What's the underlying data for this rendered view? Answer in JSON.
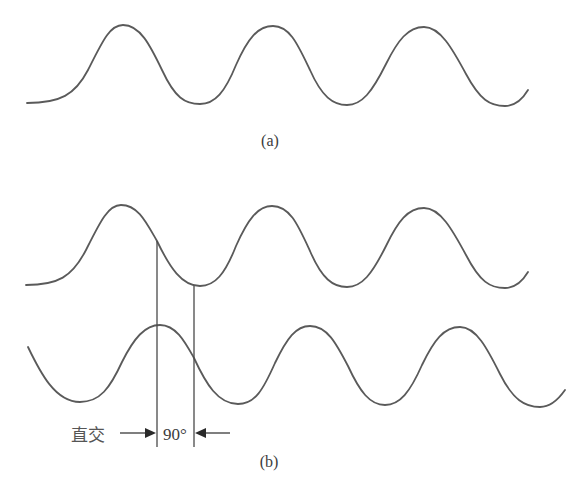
{
  "figure": {
    "panel_a": {
      "caption": "(a)",
      "description": "single sinusoidal wave, three full peaks"
    },
    "panel_b": {
      "caption": "(b)",
      "description": "two sinusoidal waves shifted by a quarter cycle",
      "annotation_label": "直交",
      "phase_label": "90°"
    },
    "colors": {
      "stroke": "#5a5a5a",
      "text": "#3c3c3c",
      "background": "#ffffff"
    }
  }
}
